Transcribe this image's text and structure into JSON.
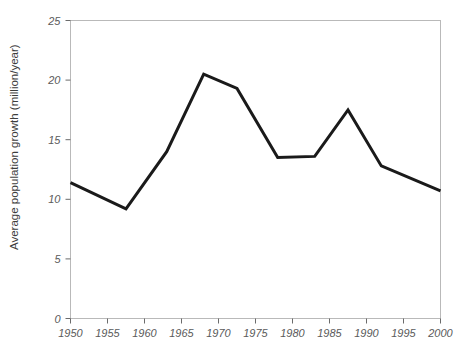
{
  "chart_data": {
    "type": "line",
    "title": "",
    "xlabel": "",
    "ylabel": "Average population growth (million/year)",
    "xlim": [
      1950,
      2000
    ],
    "ylim": [
      0,
      25
    ],
    "grid": false,
    "legend": null,
    "xticks": [
      1950,
      1955,
      1960,
      1965,
      1970,
      1975,
      1980,
      1985,
      1990,
      1995,
      2000
    ],
    "xtick_labels": [
      "1950",
      "1955",
      "1960",
      "1965",
      "1970",
      "1975",
      "1980",
      "1985",
      "1990",
      "1995",
      "2000"
    ],
    "yticks": [
      0,
      5,
      10,
      15,
      20,
      25
    ],
    "ytick_labels": [
      "0",
      "5",
      "10",
      "15",
      "20",
      "25"
    ],
    "series": [
      {
        "name": "Average population growth",
        "color": "#1a1a1a",
        "x": [
          1950,
          1957.5,
          1963,
          1968,
          1972.5,
          1978,
          1983,
          1987.5,
          1992,
          2000
        ],
        "values": [
          11.4,
          9.2,
          14.0,
          20.5,
          19.3,
          13.5,
          13.6,
          17.5,
          12.8,
          10.7
        ]
      }
    ]
  },
  "axes": {
    "y_title": "Average population growth (million/year)"
  }
}
